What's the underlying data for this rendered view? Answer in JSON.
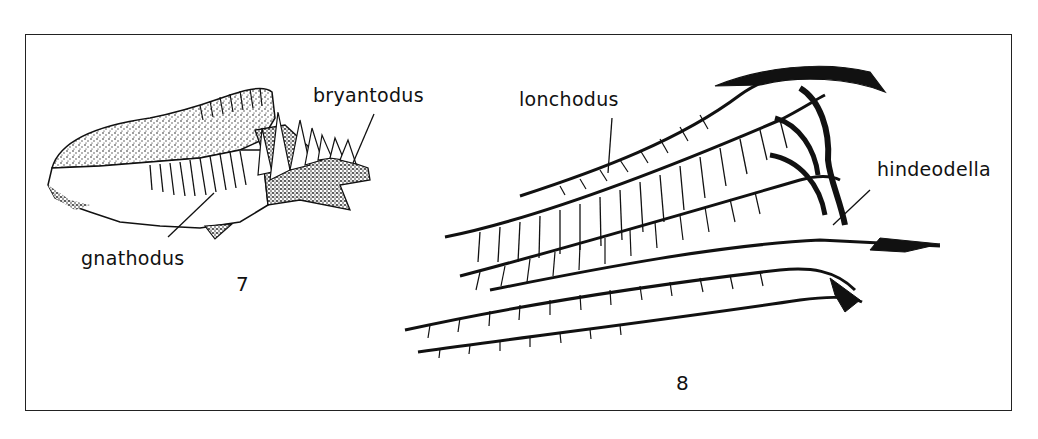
{
  "figure": {
    "specimens": [
      {
        "figure_number": "7",
        "labels": [
          "bryantodus",
          "gnathodus"
        ]
      },
      {
        "figure_number": "8",
        "labels": [
          "lonchodus",
          "hindeodella"
        ]
      }
    ]
  },
  "labels": {
    "bryantodus": "bryantodus",
    "gnathodus": "gnathodus",
    "lonchodus": "lonchodus",
    "hindeodella": "hindeodella"
  },
  "figure_numbers": {
    "fig7": "7",
    "fig8": "8"
  },
  "colors": {
    "ink": "#111111",
    "background": "#ffffff",
    "frame": "#222222"
  }
}
